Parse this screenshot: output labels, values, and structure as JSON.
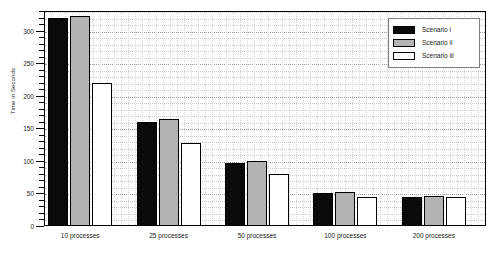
{
  "chart_data": {
    "type": "bar",
    "title": "",
    "xlabel": "",
    "ylabel": "Time in Seconds",
    "ylim": [
      0,
      330
    ],
    "yticks": [
      0,
      50,
      100,
      150,
      200,
      250,
      300
    ],
    "ytick_labels": [
      "0",
      "50",
      "100",
      "150",
      "200",
      "250",
      "300"
    ],
    "minor_tick_step": 10,
    "grid": true,
    "legend_position": "upper right",
    "categories": [
      "10 processes",
      "25 processes",
      "50 processes",
      "100 processes",
      "200 processes"
    ],
    "series": [
      {
        "name": "Scenario i",
        "color": "#0a0a0a",
        "values": [
          320,
          160,
          97,
          50,
          44
        ]
      },
      {
        "name": "Scenario ii",
        "color": "#b3b3b3",
        "values": [
          322,
          165,
          100,
          52,
          46
        ]
      },
      {
        "name": "Scenario iii",
        "color": "#ffffff",
        "values": [
          220,
          128,
          80,
          45,
          45
        ]
      }
    ]
  },
  "legend": {
    "entries": [
      {
        "label": "Scenario i"
      },
      {
        "label": "Scenario ii"
      },
      {
        "label": "Scenario iii"
      }
    ]
  }
}
